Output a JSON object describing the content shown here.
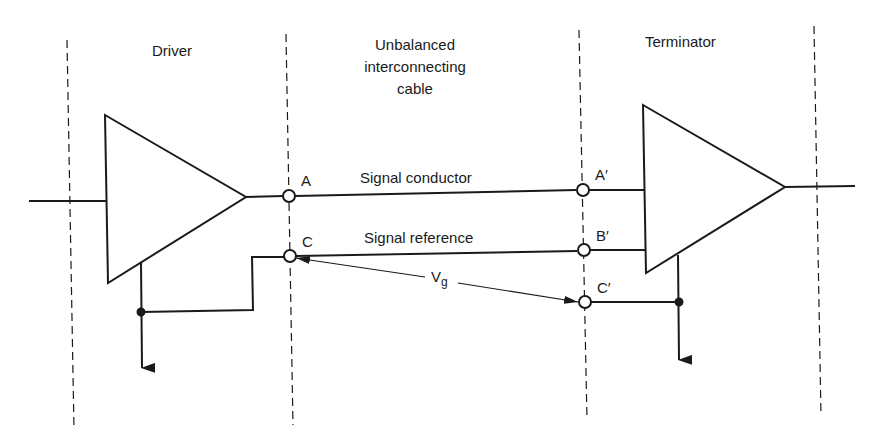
{
  "sections": {
    "driver": "Driver",
    "cable_line1": "Unbalanced",
    "cable_line2": "interconnecting",
    "cable_line3": "cable",
    "terminator": "Terminator"
  },
  "nodes": {
    "A": "A",
    "C": "C",
    "A_prime": "A′",
    "B_prime": "B′",
    "C_prime": "C′"
  },
  "conductors": {
    "signal": "Signal conductor",
    "reference": "Signal reference"
  },
  "voltage": {
    "main": "V",
    "sub": "g"
  },
  "colors": {
    "stroke": "#1a1a1a",
    "background": "#ffffff"
  }
}
